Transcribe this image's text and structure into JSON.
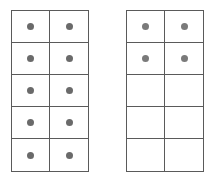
{
  "frames": [
    {
      "name": "left-ten-frame",
      "rows": 5,
      "cols": 2,
      "filled": [
        true,
        true,
        true,
        true,
        true,
        true,
        true,
        true,
        true,
        true
      ],
      "filled_count": 10
    },
    {
      "name": "right-ten-frame",
      "rows": 5,
      "cols": 2,
      "filled": [
        true,
        true,
        true,
        true,
        false,
        false,
        false,
        false,
        false,
        false
      ],
      "filled_count": 4
    }
  ],
  "colors": {
    "grid_line": "#5a5a5a",
    "dot_left": "#6a6a6a",
    "dot_right": "#7a7a7a",
    "background": "#ffffff"
  }
}
